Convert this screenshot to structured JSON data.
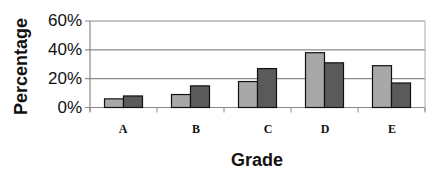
{
  "chart_data": {
    "type": "bar",
    "title": "",
    "xlabel": "Grade",
    "ylabel": "Percentage",
    "categories": [
      "A",
      "B",
      "C",
      "D",
      "E"
    ],
    "series": [
      {
        "name": "Series 1",
        "color": "#a8a8a8",
        "values": [
          6,
          9,
          18,
          38,
          29
        ]
      },
      {
        "name": "Series 2",
        "color": "#5a5a5a",
        "values": [
          8,
          15,
          27,
          31,
          17
        ]
      }
    ],
    "ylim": [
      0,
      60
    ],
    "yticks": [
      "0%",
      "20%",
      "40%",
      "60%"
    ],
    "ytick_values": [
      0,
      20,
      40,
      60
    ],
    "grid": true,
    "legend": "none"
  }
}
